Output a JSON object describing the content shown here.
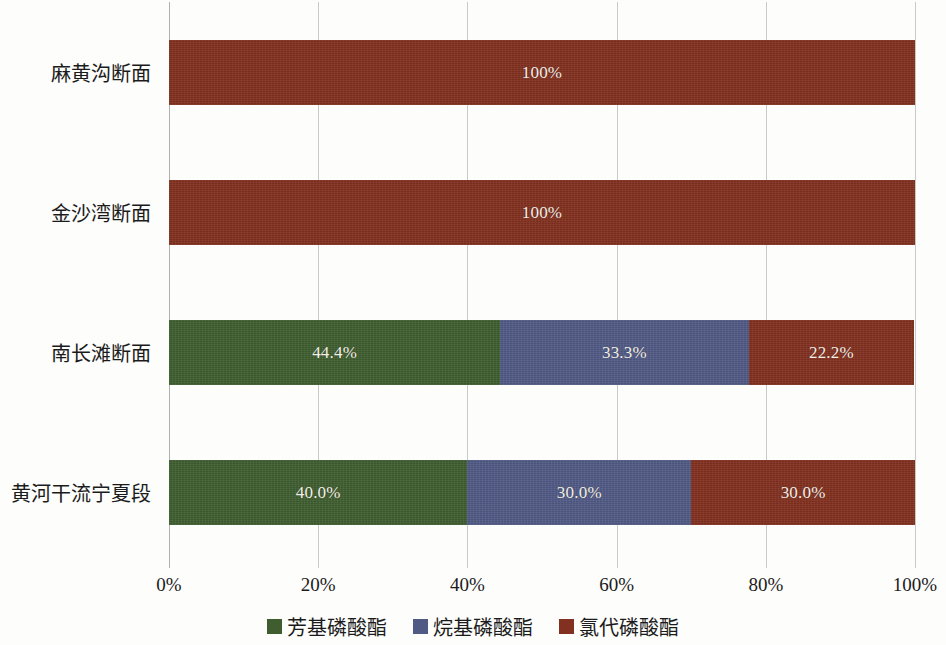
{
  "chart_data": {
    "type": "bar",
    "orientation": "horizontal",
    "stacked": true,
    "normalized": "100%",
    "title": "",
    "subtitle": "",
    "xlabel": "",
    "ylabel": "",
    "xlim": [
      0,
      100
    ],
    "x_tick_labels": [
      "0%",
      "20%",
      "40%",
      "60%",
      "80%",
      "100%"
    ],
    "x_tick_values": [
      0,
      20,
      40,
      60,
      80,
      100
    ],
    "grid": "vertical",
    "legend_position": "bottom-center",
    "categories": [
      "黄河干流宁夏段",
      "南长滩断面",
      "金沙湾断面",
      "麻黄沟断面"
    ],
    "series": [
      {
        "name": "芳基磷酸酯",
        "color": "#3f5d2f",
        "values": [
          40.0,
          44.4,
          0,
          0
        ],
        "labels": [
          "40.0%",
          "44.4%",
          "",
          ""
        ]
      },
      {
        "name": "烷基磷酸酯",
        "color": "#515a85",
        "values": [
          30.0,
          33.3,
          0,
          0
        ],
        "labels": [
          "30.0%",
          "33.3%",
          "",
          ""
        ]
      },
      {
        "name": "氯代磷酸酯",
        "color": "#82301f",
        "values": [
          30.0,
          22.2,
          100,
          100
        ],
        "labels": [
          "30.0%",
          "22.2%",
          "100%",
          "100%"
        ]
      }
    ],
    "rows": [
      {
        "category": "麻黄沟断面",
        "top": 40,
        "segments": [
          {
            "series": "氯代磷酸酯",
            "value": 100,
            "label": "100%",
            "color": "#82301f"
          }
        ]
      },
      {
        "category": "金沙湾断面",
        "top": 180,
        "segments": [
          {
            "series": "氯代磷酸酯",
            "value": 100,
            "label": "100%",
            "color": "#82301f"
          }
        ]
      },
      {
        "category": "南长滩断面",
        "top": 320,
        "segments": [
          {
            "series": "芳基磷酸酯",
            "value": 44.4,
            "label": "44.4%",
            "color": "#3f5d2f"
          },
          {
            "series": "烷基磷酸酯",
            "value": 33.3,
            "label": "33.3%",
            "color": "#515a85"
          },
          {
            "series": "氯代磷酸酯",
            "value": 22.2,
            "label": "22.2%",
            "color": "#82301f"
          }
        ]
      },
      {
        "category": "黄河干流宁夏段",
        "top": 460,
        "segments": [
          {
            "series": "芳基磷酸酯",
            "value": 40.0,
            "label": "40.0%",
            "color": "#3f5d2f"
          },
          {
            "series": "烷基磷酸酯",
            "value": 30.0,
            "label": "30.0%",
            "color": "#515a85"
          },
          {
            "series": "氯代磷酸酯",
            "value": 30.0,
            "label": "30.0%",
            "color": "#82301f"
          }
        ]
      }
    ]
  },
  "axis": {
    "ticks": [
      {
        "label": "0%",
        "pct": 0
      },
      {
        "label": "20%",
        "pct": 20
      },
      {
        "label": "40%",
        "pct": 40
      },
      {
        "label": "60%",
        "pct": 60
      },
      {
        "label": "80%",
        "pct": 80
      },
      {
        "label": "100%",
        "pct": 100
      }
    ]
  },
  "category_labels": [
    {
      "text": "麻黄沟断面",
      "center": 72
    },
    {
      "text": "金沙湾断面",
      "center": 212
    },
    {
      "text": "南长滩断面",
      "center": 352
    },
    {
      "text": "黄河干流宁夏段",
      "center": 492
    }
  ],
  "legend": {
    "items": [
      {
        "label": "芳基磷酸酯",
        "color": "#3f5d2f"
      },
      {
        "label": "烷基磷酸酯",
        "color": "#515a85"
      },
      {
        "label": "氯代磷酸酯",
        "color": "#82301f"
      }
    ]
  },
  "colors": {
    "aryl_phosphate_green": "#3f5d2f",
    "alkyl_phosphate_blue": "#515a85",
    "chlorinated_phosphate_red": "#82301f",
    "gridline": "#c9c9c7",
    "axis_line": "#b0b0ae",
    "background": "#fdfdfb",
    "text": "#1b1b1b",
    "bar_label_text": "#f3efe6"
  }
}
